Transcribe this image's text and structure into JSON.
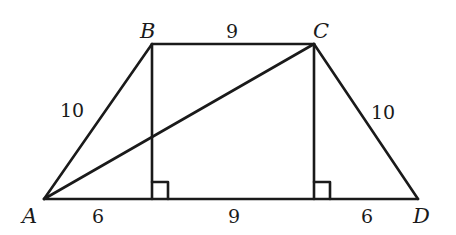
{
  "diagram": {
    "type": "trapezoid",
    "points": {
      "A": {
        "label": "A",
        "x": 44,
        "y": 199
      },
      "B": {
        "label": "B",
        "x": 152,
        "y": 44
      },
      "C": {
        "label": "C",
        "x": 314,
        "y": 44
      },
      "D": {
        "label": "D",
        "x": 418,
        "y": 199
      }
    },
    "feet": {
      "B_foot": {
        "x": 152,
        "y": 199
      },
      "C_foot": {
        "x": 314,
        "y": 199
      }
    },
    "lengths": {
      "AB": "10",
      "BC": "9",
      "CD": "10",
      "A_to_Bfoot": "6",
      "Bfoot_to_Cfoot": "9",
      "Cfoot_to_D": "6"
    },
    "segments": [
      "AB",
      "BC",
      "CD",
      "DA",
      "AC",
      "B-Bfoot",
      "C-Cfoot"
    ],
    "right_angle_markers": [
      "at B_foot",
      "at C_foot"
    ],
    "stroke_color": "#1a1a1a"
  }
}
